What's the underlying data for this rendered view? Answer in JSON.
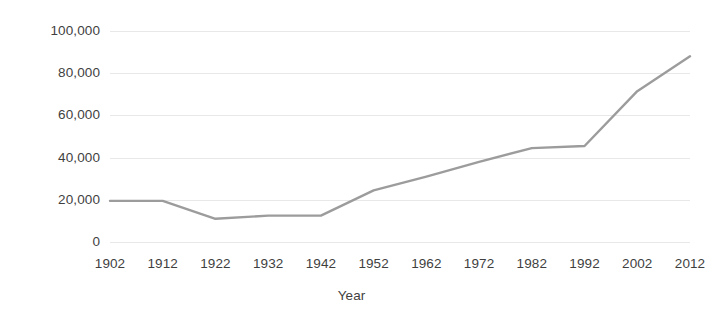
{
  "chart_data": {
    "type": "line",
    "title": "",
    "subtitle": "",
    "xlabel": "Year",
    "ylabel": "",
    "categories": [
      "1902",
      "1912",
      "1922",
      "1932",
      "1942",
      "1952",
      "1962",
      "1972",
      "1982",
      "1992",
      "2002",
      "2012"
    ],
    "x": [
      1902,
      1912,
      1922,
      1932,
      1942,
      1952,
      1962,
      1972,
      1982,
      1992,
      2002,
      2012
    ],
    "values": [
      19500,
      19500,
      11000,
      12500,
      12500,
      24500,
      31000,
      38000,
      44500,
      45500,
      71500,
      88000
    ],
    "series": [
      {
        "name": "",
        "values": [
          19500,
          19500,
          11000,
          12500,
          12500,
          24500,
          31000,
          38000,
          44500,
          45500,
          71500,
          88000
        ]
      }
    ],
    "ylim": [
      0,
      100000
    ],
    "yticks": [
      0,
      20000,
      40000,
      60000,
      80000,
      100000
    ],
    "ytick_labels": [
      "0",
      "20,000",
      "40,000",
      "60,000",
      "80,000",
      "100,000"
    ],
    "xtick_labels": [
      "1902",
      "1912",
      "1922",
      "1932",
      "1942",
      "1952",
      "1962",
      "1972",
      "1982",
      "1992",
      "2002",
      "2012"
    ],
    "grid": true,
    "grid_axis": "y",
    "grid_color": "#e8e8e8",
    "legend": false,
    "legend_position": "none",
    "line_color": "#9c9c9c",
    "line_width": 2.4,
    "markers": false,
    "background_color": "#ffffff",
    "text_color": "#3f3f3f",
    "annotations": []
  }
}
